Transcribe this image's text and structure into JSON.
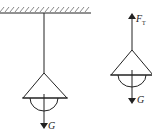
{
  "diagram": {
    "left_figure": {
      "description": "Lamp hanging from ceiling by a cord",
      "weight_label": "G"
    },
    "right_figure": {
      "description": "Free-body diagram of lamp",
      "tension_label": "F",
      "tension_subscript": "T",
      "weight_label": "G"
    },
    "colors": {
      "stroke": "#222222",
      "background": "#ffffff"
    }
  }
}
